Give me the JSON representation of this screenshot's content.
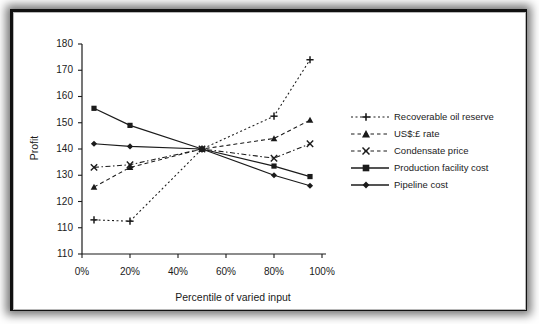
{
  "chart_data": {
    "type": "line",
    "title": "",
    "xlabel": "Percentile of varied input",
    "ylabel": "Profit",
    "grid": false,
    "legend_position": "right",
    "x": [
      5,
      20,
      50,
      80,
      95
    ],
    "xtick_labels": [
      "0%",
      "20%",
      "40%",
      "60%",
      "80%",
      "100%"
    ],
    "xtick_values": [
      0,
      20,
      40,
      60,
      80,
      100
    ],
    "xlim": [
      0,
      100
    ],
    "ytick_labels": [
      "180",
      "170",
      "160",
      "150",
      "140",
      "130",
      "120",
      "110",
      "110"
    ],
    "ytick_values": [
      180,
      170,
      160,
      150,
      140,
      130,
      120,
      110,
      100
    ],
    "ylim": [
      100,
      180
    ],
    "series": [
      {
        "name": "Recoverable oil reserve",
        "marker": "plus",
        "line_style": "dotted",
        "color": "#1b1b1b",
        "values": [
          113,
          112.5,
          140,
          152.5,
          174
        ]
      },
      {
        "name": "US$:£ rate",
        "marker": "triangle",
        "line_style": "dashed",
        "color": "#1b1b1b",
        "values": [
          125.5,
          133,
          140,
          144,
          151
        ]
      },
      {
        "name": "Condensate price",
        "marker": "x",
        "line_style": "dash-dot",
        "color": "#1b1b1b",
        "values": [
          133,
          134,
          140,
          136.5,
          142
        ]
      },
      {
        "name": "Production facility cost",
        "marker": "square",
        "line_style": "solid",
        "color": "#1b1b1b",
        "values": [
          155.5,
          149,
          140,
          133.5,
          129.5
        ]
      },
      {
        "name": "Pipeline cost",
        "marker": "diamond",
        "line_style": "solid",
        "color": "#1b1b1b",
        "values": [
          142,
          141,
          140,
          130,
          126
        ]
      }
    ]
  },
  "axes": {
    "y_label": "Profit",
    "x_label": "Percentile of varied input",
    "y_ticks": [
      "180",
      "170",
      "160",
      "150",
      "140",
      "130",
      "120",
      "110",
      "110"
    ],
    "x_ticks": [
      "0%",
      "20%",
      "40%",
      "60%",
      "80%",
      "100%"
    ]
  },
  "legend": {
    "items": [
      {
        "label": "Recoverable oil reserve",
        "marker": "plus-marker",
        "style": "dotted"
      },
      {
        "label": "US$:£ rate",
        "marker": "triangle-marker",
        "style": "dashed"
      },
      {
        "label": "Condensate price",
        "marker": "x-marker",
        "style": "dash-dot"
      },
      {
        "label": "Production facility cost",
        "marker": "square-marker",
        "style": "solid"
      },
      {
        "label": "Pipeline cost",
        "marker": "diamond-marker",
        "style": "solid"
      }
    ]
  },
  "colors": {
    "ink": "#1b1b1b",
    "frame": "#111111",
    "page": "#ffffff"
  }
}
